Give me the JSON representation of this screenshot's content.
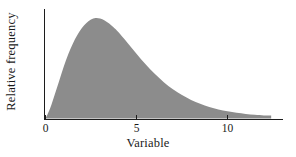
{
  "chart_data": {
    "type": "area",
    "title": "",
    "subtitle": "",
    "xlabel": "Variable",
    "ylabel": "Relative frequency",
    "fill_color": "#8c8c8c",
    "axis_color": "#1c1c1c",
    "grid": false,
    "legend": null,
    "xlim": [
      -0.6,
      13.1
    ],
    "ylim": [
      0,
      1.06
    ],
    "xticks": [
      0,
      5,
      10
    ],
    "xtick_labels": [
      "0",
      "5",
      "10"
    ],
    "yticks": [],
    "ytick_labels": [],
    "peak_x": 2.6,
    "peak_y": 1.0,
    "x": [
      0,
      0.25,
      0.5,
      0.75,
      1,
      1.25,
      1.5,
      1.75,
      2,
      2.25,
      2.5,
      2.75,
      3,
      3.25,
      3.5,
      3.75,
      4,
      4.5,
      5,
      5.5,
      6,
      6.5,
      7,
      7.5,
      8,
      8.5,
      9,
      9.5,
      10,
      10.5,
      11,
      11.5,
      12,
      12.4
    ],
    "values": [
      0,
      0.1,
      0.235,
      0.375,
      0.515,
      0.64,
      0.745,
      0.83,
      0.9,
      0.95,
      0.985,
      1.0,
      0.995,
      0.975,
      0.945,
      0.905,
      0.86,
      0.755,
      0.645,
      0.54,
      0.445,
      0.362,
      0.292,
      0.234,
      0.186,
      0.147,
      0.116,
      0.091,
      0.072,
      0.057,
      0.046,
      0.038,
      0.032,
      0.03
    ]
  },
  "axes": {
    "xlabel": "Variable",
    "ylabel": "Relative frequency",
    "xtick_0": "0",
    "xtick_5": "5",
    "xtick_10": "10"
  }
}
